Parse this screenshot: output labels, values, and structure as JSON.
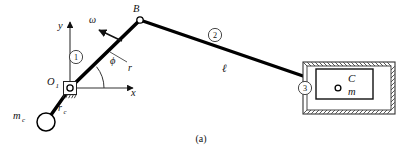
{
  "figure": {
    "caption": "(a)",
    "type": "slider-crank-mechanism-diagram",
    "colors": {
      "link": "#000000",
      "thin_line": "#555555",
      "hatch": "#444444",
      "text": "#111111",
      "background": "#ffffff"
    }
  },
  "axes": {
    "y_label": "y",
    "x_label": "x",
    "origin_label": "O",
    "origin_subscript": "1"
  },
  "labels": {
    "point_b": "B",
    "omega": "ω",
    "crank_length": "r",
    "angle": "ϕ",
    "link_length": "ℓ",
    "counterweight_mass": "m",
    "counterweight_subscript": "c",
    "counterweight_radius": "r",
    "counterweight_radius_subscript": "c",
    "slider_point": "C",
    "slider_mass": "m"
  },
  "link_numbers": {
    "crank": "1",
    "connecting_rod": "2",
    "slider": "3"
  },
  "geometry": {
    "pivot_o1": [
      70,
      88
    ],
    "point_b": [
      140,
      20
    ],
    "slider_pin_c": [
      338,
      88
    ],
    "counterweight_center": [
      46,
      122
    ],
    "counterweight_radius_px": 9,
    "guide_box": [
      303,
      62,
      92,
      52
    ],
    "slider_box": [
      316,
      69,
      57,
      30
    ]
  }
}
